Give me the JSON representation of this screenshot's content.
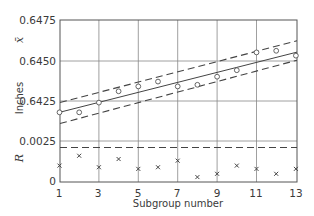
{
  "chart_data": [
    {
      "type": "line",
      "title": "X-bar chart",
      "ylabel": "Inches",
      "symbol": "x̄",
      "xlabel": "Subgroup number",
      "ylim": [
        0.64,
        0.6475
      ],
      "yticks": [
        "0.6475",
        "0.6450",
        "0.6425"
      ],
      "x": [
        1,
        2,
        3,
        4,
        5,
        6,
        7,
        8,
        9,
        10,
        11,
        12,
        13
      ],
      "series": [
        {
          "name": "Subgroup mean",
          "marker": "circle",
          "values": [
            0.6418,
            0.6418,
            0.6424,
            0.6431,
            0.6434,
            0.6437,
            0.6434,
            0.6435,
            0.644,
            0.6444,
            0.6455,
            0.6456,
            0.6453
          ]
        },
        {
          "name": "Center line (trend)",
          "style": "solid",
          "endpoints": [
            [
              1,
              0.6418
            ],
            [
              13,
              0.6455
            ]
          ]
        },
        {
          "name": "Upper control limit",
          "style": "dashed",
          "endpoints": [
            [
              1,
              0.6424
            ],
            [
              13,
              0.6462
            ]
          ]
        },
        {
          "name": "Lower control limit",
          "style": "dashed",
          "endpoints": [
            [
              1,
              0.6411
            ],
            [
              13,
              0.645
            ]
          ]
        }
      ],
      "grid": true
    },
    {
      "type": "scatter",
      "title": "R chart",
      "ylabel": "R",
      "symbol": "R",
      "xlabel": "Subgroup number",
      "ylim": [
        0,
        0.0025
      ],
      "yticks": [
        "0.0025",
        "0"
      ],
      "x": [
        1,
        2,
        3,
        4,
        5,
        6,
        7,
        8,
        9,
        10,
        11,
        12,
        13
      ],
      "series": [
        {
          "name": "Subgroup range",
          "marker": "x",
          "values": [
            0.001,
            0.0016,
            0.0009,
            0.0014,
            0.0008,
            0.0009,
            0.0013,
            0.0003,
            0.0005,
            0.001,
            0.0008,
            0.0005,
            0.0008
          ]
        },
        {
          "name": "R-bar limit",
          "style": "dashed",
          "value": 0.0021
        }
      ],
      "grid": true
    }
  ],
  "labels": {
    "xbar_symbol": "x̄",
    "r_symbol": "R",
    "ylabel": "Inches",
    "xlabel": "Subgroup number",
    "yticks_upper": [
      "0.6475",
      "0.6450",
      "0.6425"
    ],
    "yticks_lower": [
      "0.0025",
      "0"
    ],
    "xticks": [
      "1",
      "3",
      "5",
      "7",
      "9",
      "11",
      "13"
    ]
  },
  "colors": {
    "ink": "#444444",
    "grid": "#888888",
    "background": "#ffffff"
  }
}
